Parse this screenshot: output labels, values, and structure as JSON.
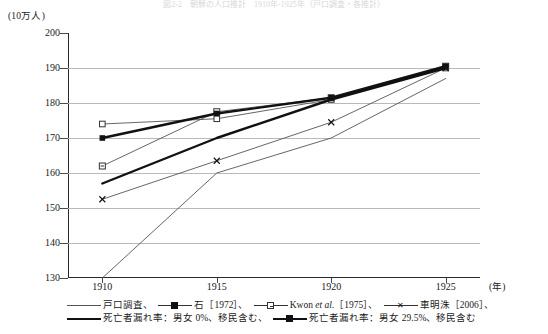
{
  "title_faint": "図2-2　朝鮮の人口推計　1910年-1925年（戸口調査・各推計）",
  "axes": {
    "y_unit": "(10万人)",
    "x_unit": "(年)",
    "y_ticks": [
      200,
      190,
      180,
      170,
      160,
      150,
      140,
      130
    ],
    "x_ticks": [
      "1910",
      "1915",
      "1920",
      "1925"
    ]
  },
  "legend": {
    "entries": [
      {
        "label": "戸口調査、",
        "style": "thin",
        "marker": "none"
      },
      {
        "label": "石［1972］、",
        "style": "med",
        "marker": "filled-square"
      },
      {
        "label": "Kwon ",
        "label_italic": "et al.",
        "label_tail": "［1975］、",
        "style": "med",
        "marker": "cross-square"
      },
      {
        "label": "車明洙［2006］、",
        "style": "med",
        "marker": "x"
      },
      {
        "label": "死亡者漏れ率：男女 0%、移民含む、",
        "style": "thick",
        "marker": "none"
      },
      {
        "label": "死亡者漏れ率：男女 29.5%、移民含む",
        "style": "thick",
        "marker": "filled-square"
      }
    ]
  },
  "chart_data": {
    "type": "line",
    "title": "図2-2　朝鮮の人口推計　1910年-1925年（戸口調査・各推計）",
    "xlabel": "(年)",
    "ylabel": "(10万人)",
    "x": [
      1910,
      1915,
      1920,
      1925
    ],
    "xlim": [
      1908.5,
      1926.5
    ],
    "ylim": [
      130,
      200
    ],
    "grid": true,
    "legend_position": "bottom",
    "series": [
      {
        "name": "戸口調査",
        "marker": "none",
        "line": "thin",
        "values": [
          130.0,
          160.0,
          170.0,
          187.0
        ]
      },
      {
        "name": "石［1972］",
        "marker": "open-square",
        "line": "thin",
        "values": [
          174.0,
          175.5,
          181.0,
          190.0
        ]
      },
      {
        "name": "Kwon et al.［1975］",
        "marker": "cross-square",
        "line": "thin",
        "values": [
          162.0,
          177.5,
          181.5,
          190.5
        ]
      },
      {
        "name": "車明洙［2006］",
        "marker": "x",
        "line": "thin",
        "values": [
          152.5,
          163.5,
          174.5,
          190.0
        ]
      },
      {
        "name": "死亡者漏れ率：男女 0%、移民含む",
        "marker": "none",
        "line": "thick",
        "values": [
          157.0,
          170.0,
          181.0,
          190.0
        ]
      },
      {
        "name": "死亡者漏れ率：男女 29.5%、移民含む",
        "marker": "filled-square",
        "line": "thick",
        "values": [
          170.0,
          177.0,
          181.5,
          190.5
        ]
      }
    ]
  }
}
